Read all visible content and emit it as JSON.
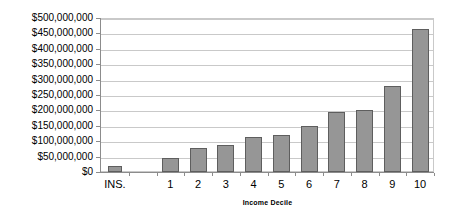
{
  "chart_data": {
    "type": "bar",
    "title": "",
    "xlabel": "Income Decile",
    "ylabel": "",
    "categories": [
      "INS.",
      "",
      "1",
      "2",
      "3",
      "4",
      "5",
      "6",
      "7",
      "8",
      "9",
      "10"
    ],
    "values": [
      20000000,
      null,
      45000000,
      78000000,
      88000000,
      115000000,
      120000000,
      150000000,
      195000000,
      202000000,
      278000000,
      465000000
    ],
    "ylim": [
      0,
      500000000
    ],
    "ytick_values": [
      0,
      50000000,
      100000000,
      150000000,
      200000000,
      250000000,
      300000000,
      350000000,
      400000000,
      450000000,
      500000000
    ],
    "ytick_labels": [
      "$0",
      "$50,000,000",
      "$100,000,000",
      "$150,000,000",
      "$200,000,000",
      "$250,000,000",
      "$300,000,000",
      "$350,000,000",
      "$400,000,000",
      "$450,000,000",
      "$500,000,000"
    ],
    "grid": true,
    "legend": false,
    "legend_position": "none",
    "bar_color": "#969696",
    "bar_border_color": "#5e5e5e",
    "grid_color": "#c9c9c9",
    "axis_color": "#8c8c8c",
    "background_color": "#ffffff",
    "text_color": "#000000"
  }
}
